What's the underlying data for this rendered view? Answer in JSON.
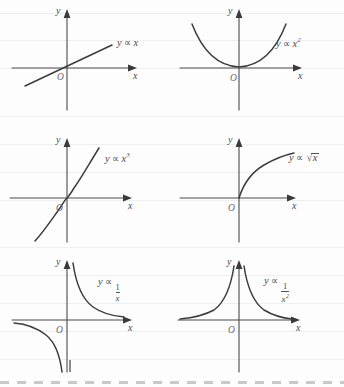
{
  "page": {
    "paper_color": "#fdfdfd",
    "ink_color": "#3c3c3c",
    "rule_color": "#efefef",
    "layout": "2 columns x 3 rows"
  },
  "axis_labels": {
    "x": "x",
    "y": "y",
    "origin": "O"
  },
  "panels": [
    {
      "id": "linear",
      "equation_plain": "y ∝ x",
      "y_label": "y",
      "prop_symbol": "∝",
      "expr": "x",
      "exponent": "",
      "shape": "straight line through origin, positive slope",
      "quadrants": "I and III",
      "label_position": "upper-right"
    },
    {
      "id": "quadratic",
      "equation_plain": "y ∝ x²",
      "y_label": "y",
      "prop_symbol": "∝",
      "expr": "x",
      "exponent": "2",
      "shape": "upward parabola, vertex at origin",
      "quadrants": "I and II",
      "label_position": "right"
    },
    {
      "id": "cubic",
      "equation_plain": "y ∝ x³",
      "y_label": "y",
      "prop_symbol": "∝",
      "expr": "x",
      "exponent": "3",
      "shape": "cubic curve, odd symmetry about origin",
      "quadrants": "I and III",
      "label_position": "upper-right"
    },
    {
      "id": "sqrt",
      "equation_plain": "y ∝ √x",
      "y_label": "y",
      "prop_symbol": "∝",
      "expr": "x",
      "radical": "√",
      "shape": "square-root curve rising and flattening",
      "quadrants": "I only",
      "label_position": "right"
    },
    {
      "id": "inverse",
      "equation_plain": "y ∝ 1/x",
      "y_label": "y",
      "prop_symbol": "∝",
      "numerator": "1",
      "denominator": "x",
      "denominator_exponent": "",
      "shape": "rectangular hyperbola, two branches",
      "quadrants": "I and III",
      "label_position": "upper-right"
    },
    {
      "id": "inverse-square",
      "equation_plain": "y ∝ 1/x²",
      "y_label": "y",
      "prop_symbol": "∝",
      "numerator": "1",
      "denominator": "x",
      "denominator_exponent": "2",
      "shape": "inverse square curve, both branches above x-axis",
      "quadrants": "I and II",
      "label_position": "upper-right"
    }
  ]
}
